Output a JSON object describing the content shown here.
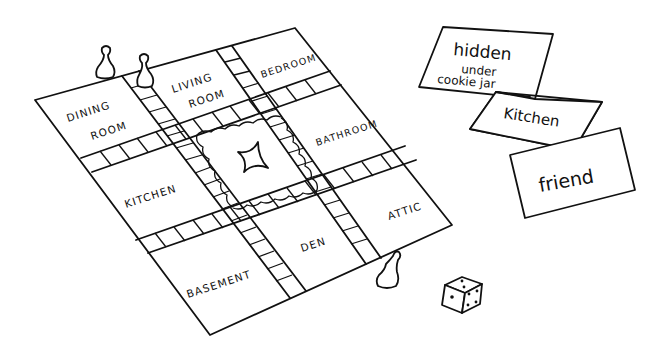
{
  "scene": {
    "description": "Line drawing of a mystery board game with room tiles, pawns, clue cards and a die",
    "ink_color": "#111111",
    "background": "#ffffff"
  },
  "board": {
    "rooms": [
      {
        "id": "dining-room",
        "line1": "DINING",
        "line2": "ROOM"
      },
      {
        "id": "living-room",
        "line1": "LIVING",
        "line2": "ROOM"
      },
      {
        "id": "bedroom",
        "line1": "BEDROOM"
      },
      {
        "id": "bathroom",
        "line1": "BATHROOM"
      },
      {
        "id": "kitchen",
        "line1": "KITCHEN"
      },
      {
        "id": "attic",
        "line1": "ATTIC"
      },
      {
        "id": "basement",
        "line1": "BASEMENT"
      },
      {
        "id": "den",
        "line1": "DEN"
      }
    ],
    "center": {
      "symbol": "four-point-star"
    }
  },
  "pawns": [
    {
      "id": "pawn-1",
      "location": "top edge near dining room"
    },
    {
      "id": "pawn-2",
      "location": "top edge near living room"
    },
    {
      "id": "pawn-3",
      "location": "bottom edge near attic"
    }
  ],
  "cards": [
    {
      "id": "card-where",
      "lines": [
        "hidden",
        "under",
        "cookie jar"
      ]
    },
    {
      "id": "card-room",
      "lines": [
        "Kitchen"
      ]
    },
    {
      "id": "card-who",
      "lines": [
        "friend"
      ]
    }
  ],
  "die": {
    "top_face": 2,
    "left_face": 1,
    "right_face": 4
  }
}
